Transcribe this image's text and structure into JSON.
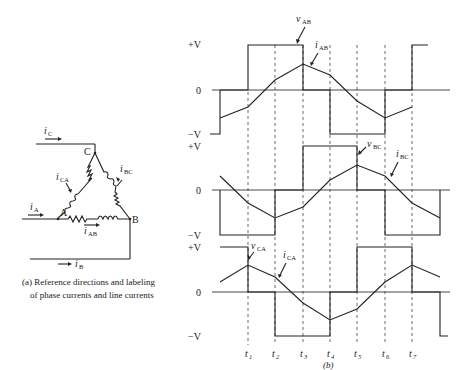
{
  "figure_a": {
    "caption_line1": "(a) Reference directions and labeling",
    "caption_line2": "of phase currents and line currents",
    "nodes": [
      "A",
      "B",
      "C"
    ],
    "line_currents": [
      "iA",
      "iB",
      "iC"
    ],
    "phase_currents": [
      "iAB",
      "iBC",
      "iCA"
    ]
  },
  "figure_b": {
    "caption": "(b)",
    "levels": {
      "plus": "+V",
      "zero": "0",
      "minus": "−V"
    },
    "time_marks": [
      "t1",
      "t2",
      "t3",
      "t4",
      "t5",
      "t6",
      "t7"
    ],
    "panels": [
      {
        "voltage": "vAB",
        "current": "iAB"
      },
      {
        "voltage": "vBC",
        "current": "iBC"
      },
      {
        "voltage": "vCA",
        "current": "iCA"
      }
    ]
  }
}
